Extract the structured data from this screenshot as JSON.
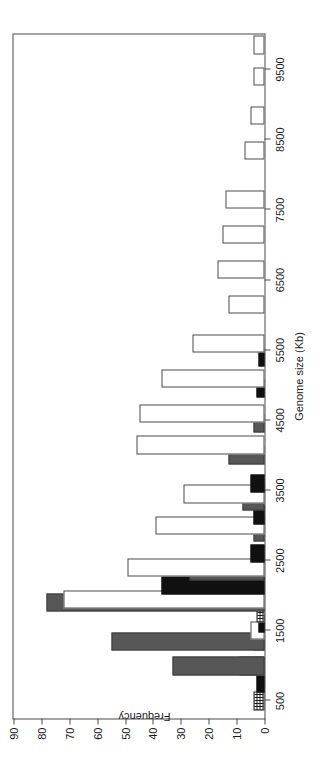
{
  "chart_data": {
    "type": "bar",
    "title": "",
    "xlabel": "Genome size (Kb)",
    "ylabel": "Frequency",
    "orientation": "rotated-90-ccw",
    "grid": false,
    "legend": "none",
    "ylim": [
      0,
      90
    ],
    "ytick_labels": [
      "0",
      "10",
      "20",
      "30",
      "40",
      "50",
      "60",
      "70",
      "80",
      "90"
    ],
    "ytick_values": [
      0,
      10,
      20,
      30,
      40,
      50,
      60,
      70,
      80,
      90
    ],
    "xtick_labels": [
      "500",
      "1500",
      "2500",
      "3500",
      "4500",
      "5500",
      "6500",
      "7500",
      "8500",
      "9500"
    ],
    "xtick_values": [
      500,
      1500,
      2500,
      3500,
      4500,
      5500,
      6500,
      7500,
      8500,
      9500
    ],
    "xlim": [
      250,
      10000
    ],
    "bin_width": 500,
    "series": [
      {
        "name": "series-crosshatch",
        "style": "crosshatch",
        "color": "#ffffff",
        "values": [
          4,
          0,
          9,
          4,
          3,
          0,
          0,
          0,
          0,
          0,
          0,
          0,
          0,
          0,
          0,
          0,
          0,
          0,
          0,
          0
        ]
      },
      {
        "name": "series-black",
        "style": "solid-black",
        "color": "#101010",
        "values": [
          0,
          3,
          0,
          0,
          2,
          0,
          37,
          5,
          0,
          4,
          0,
          5,
          0,
          2,
          0,
          3,
          0,
          0,
          0,
          0
        ]
      },
      {
        "name": "series-gray",
        "style": "solid-gray",
        "color": "#575757",
        "values": [
          0,
          0,
          33,
          55,
          0,
          78,
          0,
          27,
          0,
          4,
          0,
          8,
          0,
          13,
          0,
          4,
          2,
          0,
          0,
          0
        ]
      },
      {
        "name": "series-white",
        "style": "outline-white",
        "color": "#ffffff",
        "values": [
          0,
          0,
          0,
          5,
          0,
          72,
          0,
          49,
          0,
          39,
          0,
          29,
          0,
          46,
          0,
          45,
          0,
          37,
          0,
          26
        ]
      }
    ],
    "bars": [
      {
        "bin": 500,
        "series": "series-crosshatch",
        "value": 4
      },
      {
        "bin": 750,
        "series": "series-black",
        "value": 3
      },
      {
        "bin": 1000,
        "series": "series-crosshatch",
        "value": 9
      },
      {
        "bin": 1000,
        "series": "series-gray",
        "value": 33
      },
      {
        "bin": 1350,
        "series": "series-crosshatch",
        "value": 4
      },
      {
        "bin": 1350,
        "series": "series-gray",
        "value": 55
      },
      {
        "bin": 1500,
        "series": "series-white",
        "value": 5
      },
      {
        "bin": 1600,
        "series": "series-black",
        "value": 2
      },
      {
        "bin": 1750,
        "series": "series-crosshatch",
        "value": 3
      },
      {
        "bin": 1900,
        "series": "series-gray",
        "value": 78
      },
      {
        "bin": 1950,
        "series": "series-white",
        "value": 72
      },
      {
        "bin": 2150,
        "series": "series-black",
        "value": 37
      },
      {
        "bin": 2350,
        "series": "series-gray",
        "value": 27
      },
      {
        "bin": 2400,
        "series": "series-white",
        "value": 49
      },
      {
        "bin": 2600,
        "series": "series-black",
        "value": 5
      },
      {
        "bin": 2900,
        "series": "series-gray",
        "value": 4
      },
      {
        "bin": 3000,
        "series": "series-white",
        "value": 39
      },
      {
        "bin": 3150,
        "series": "series-black",
        "value": 4
      },
      {
        "bin": 3350,
        "series": "series-gray",
        "value": 8
      },
      {
        "bin": 3450,
        "series": "series-white",
        "value": 29
      },
      {
        "bin": 3600,
        "series": "series-black",
        "value": 5
      },
      {
        "bin": 4000,
        "series": "series-gray",
        "value": 13
      },
      {
        "bin": 4150,
        "series": "series-white",
        "value": 46
      },
      {
        "bin": 4450,
        "series": "series-gray",
        "value": 4
      },
      {
        "bin": 4600,
        "series": "series-white",
        "value": 45
      },
      {
        "bin": 4950,
        "series": "series-black",
        "value": 3
      },
      {
        "bin": 5100,
        "series": "series-white",
        "value": 37
      },
      {
        "bin": 5400,
        "series": "series-black",
        "value": 2
      },
      {
        "bin": 5600,
        "series": "series-white",
        "value": 26
      },
      {
        "bin": 6150,
        "series": "series-white",
        "value": 13
      },
      {
        "bin": 6650,
        "series": "series-white",
        "value": 17
      },
      {
        "bin": 7150,
        "series": "series-white",
        "value": 15
      },
      {
        "bin": 7650,
        "series": "series-white",
        "value": 14
      },
      {
        "bin": 8350,
        "series": "series-white",
        "value": 7
      },
      {
        "bin": 8850,
        "series": "series-white",
        "value": 5
      },
      {
        "bin": 9400,
        "series": "series-white",
        "value": 4
      },
      {
        "bin": 9850,
        "series": "series-white",
        "value": 4
      }
    ]
  }
}
